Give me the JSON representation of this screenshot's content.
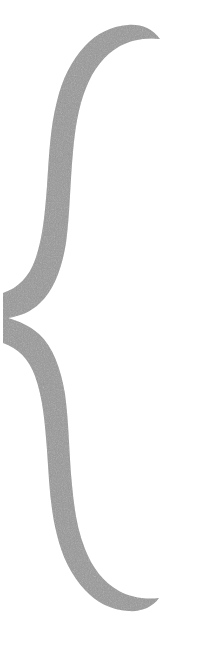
{
  "canvas": {
    "width": 220,
    "height": 647,
    "background_color": "#ffffff",
    "media": "scanned-document-fragment"
  },
  "glyph": {
    "name": "right-curly-brace",
    "character": "}",
    "semantic_label": "closing-curly-brace",
    "fill_color": "#9a9a9a",
    "texture": "halftone-dither",
    "texture_opacity": 0.34,
    "bounds": {
      "left": 5,
      "top": 38,
      "right": 161,
      "bottom": 612,
      "width": 156,
      "height": 574
    },
    "anchors": {
      "top_tip_x": 160,
      "top_tip_y": 40,
      "cusp_tip_x": 5,
      "cusp_tip_y": 318,
      "bottom_tip_x": 158,
      "bottom_tip_y": 606,
      "upper_stem_left_x": 48,
      "upper_stem_right_x": 108,
      "lower_stem_left_x": 48,
      "lower_stem_right_x": 108
    },
    "path": "M 160 39 C 146 37 131 40 120 46 C 104 55 93 70 86 88 C 78 108 75 130 73 152 C 70 183 70 214 66 243 C 62 268 54 290 40 303 C 31 312 20 316 8 318 C 19 321 30 326 39 334 C 53 347 61 369 65 394 C 69 423 69 454 72 485 C 74 507 77 529 85 549 C 92 567 103 582 119 591 C 130 597 145 600 159 598 C 152 608 140 612 128 611 C 111 610 96 602 85 590 C 71 575 62 556 57 535 C 50 508 49 479 47 450 C 45 424 43 398 35 376 C 29 359 18 348 3 343 L 3 293 C 18 288 29 277 35 260 C 43 238 45 212 47 186 C 49 157 50 128 57 101 C 62 80 71 61 85 46 C 96 34 111 26 128 25 C 140 24 152 28 160 39 Z"
  }
}
